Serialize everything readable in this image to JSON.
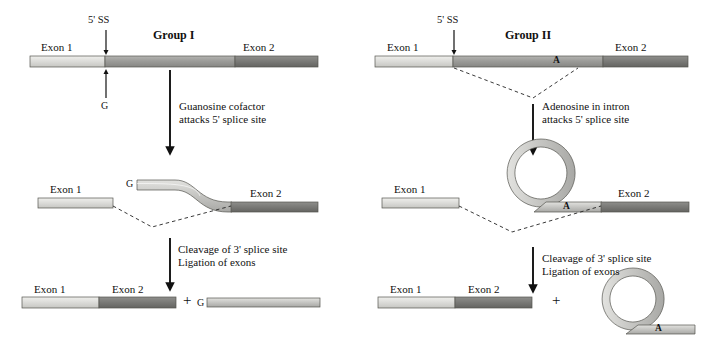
{
  "figure": {
    "title_group1": "Group I",
    "title_group2": "Group II",
    "splice_site_label": "5' SS",
    "exon1_label": "Exon 1",
    "exon2_label": "Exon 2",
    "guanosine_label": "G",
    "adenosine_label": "A",
    "plus_sign": "+"
  },
  "group1": {
    "title": "Group I",
    "stage1": {
      "ss_label": "5' SS",
      "exon1": "Exon 1",
      "exon2": "Exon 2",
      "cofactor": "G"
    },
    "step1_text_line1": "Guanosine cofactor",
    "step1_text_line2": "attacks 5' splice site",
    "stage2": {
      "g_label": "G",
      "exon1": "Exon 1",
      "exon2": "Exon 2"
    },
    "step2_text_line1": "Cleavage of 3' splice site",
    "step2_text_line2": "Ligation of exons",
    "stage3": {
      "exon1": "Exon 1",
      "exon2": "Exon 2",
      "plus": "+",
      "g_label": "G"
    }
  },
  "group2": {
    "title": "Group II",
    "stage1": {
      "ss_label": "5' SS",
      "exon1": "Exon 1",
      "exon2": "Exon 2",
      "branch_point": "A"
    },
    "step1_text_line1": "Adenosine in intron",
    "step1_text_line2": "attacks 5' splice site",
    "stage2": {
      "exon1": "Exon 1",
      "exon2": "Exon 2",
      "branch_point": "A"
    },
    "step2_text_line1": "Cleavage of 3' splice site",
    "step2_text_line2": "Ligation of exons",
    "stage3": {
      "exon1": "Exon 1",
      "exon2": "Exon 2",
      "plus": "+",
      "branch_point": "A"
    }
  },
  "colors": {
    "exon1_fill": "#d9d9d6",
    "intron_fill": "#9a9a97",
    "exon2_fill": "#7e7e7b",
    "lariat_fill": "#c9c9c6",
    "outline": "#4a4a48",
    "text": "#111111",
    "background": "#ffffff"
  }
}
